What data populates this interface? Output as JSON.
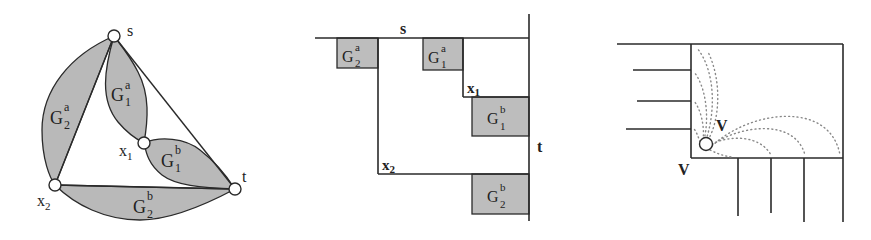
{
  "figure": {
    "panels": [
      {
        "id": "graph",
        "nodes": [
          {
            "id": "s",
            "label": "s"
          },
          {
            "id": "x1",
            "label": "x",
            "sub": "1"
          },
          {
            "id": "x2",
            "label": "x",
            "sub": "2"
          },
          {
            "id": "t",
            "label": "t"
          }
        ],
        "regions": [
          {
            "id": "G2a",
            "base": "G",
            "sub": "2",
            "sup": "a"
          },
          {
            "id": "G1a",
            "base": "G",
            "sub": "1",
            "sup": "a"
          },
          {
            "id": "G1b",
            "base": "G",
            "sub": "1",
            "sup": "b"
          },
          {
            "id": "G2b",
            "base": "G",
            "sub": "2",
            "sup": "b"
          }
        ]
      },
      {
        "id": "layout",
        "labels": {
          "s": "s",
          "t": "t",
          "x1": "x",
          "x1_sub": "1",
          "x2": "x",
          "x2_sub": "2"
        },
        "boxes": [
          {
            "id": "G2a",
            "base": "G",
            "sub": "2",
            "sup": "a"
          },
          {
            "id": "G1a",
            "base": "G",
            "sub": "1",
            "sup": "a"
          },
          {
            "id": "G1b",
            "base": "G",
            "sub": "1",
            "sup": "b"
          },
          {
            "id": "G2b",
            "base": "G",
            "sub": "2",
            "sup": "b"
          }
        ]
      },
      {
        "id": "vertex-box",
        "labels": {
          "inner_v": "V",
          "outer_v": "V"
        }
      }
    ]
  }
}
